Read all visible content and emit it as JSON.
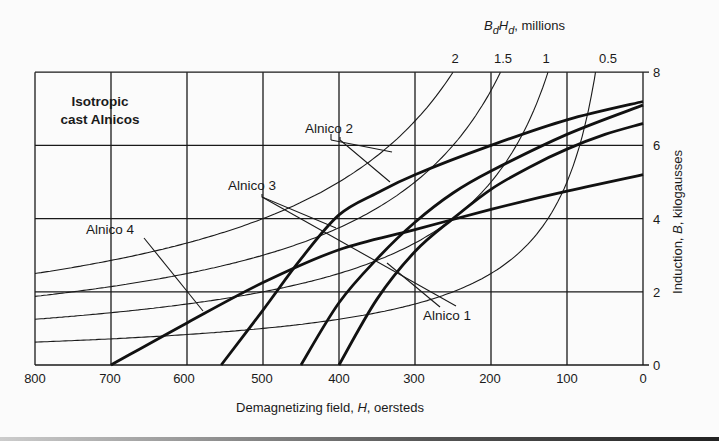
{
  "chart_data": {
    "type": "line",
    "title_line1": "Isotropic",
    "title_line2": "cast Alnicos",
    "xlabel": "Demagnetizing field, H, oersteds",
    "ylabel": "Induction, B, kilogausses",
    "top_axis_label": "BdHd, millions",
    "xlim": [
      800,
      0
    ],
    "ylim": [
      0,
      8
    ],
    "x_ticks": [
      800,
      700,
      600,
      500,
      400,
      300,
      200,
      100,
      0
    ],
    "y_ticks": [
      0,
      2,
      4,
      6,
      8
    ],
    "grid": true,
    "series": [
      {
        "name": "Alnico 1",
        "x": [
          400,
          350,
          300,
          250,
          200,
          150,
          100,
          50,
          0
        ],
        "values": [
          0,
          1.8,
          3.1,
          4.0,
          4.8,
          5.4,
          5.9,
          6.3,
          6.6
        ]
      },
      {
        "name": "Alnico 2",
        "x": [
          555,
          500,
          450,
          400,
          350,
          300,
          200,
          100,
          0
        ],
        "values": [
          0,
          1.5,
          2.9,
          4.1,
          4.7,
          5.2,
          6.0,
          6.7,
          7.2
        ]
      },
      {
        "name": "Alnico 3",
        "x": [
          450,
          400,
          350,
          300,
          250,
          200,
          100,
          0
        ],
        "values": [
          0,
          1.7,
          2.9,
          3.9,
          4.7,
          5.3,
          6.3,
          7.1
        ]
      },
      {
        "name": "Alnico 4",
        "x": [
          700,
          600,
          500,
          400,
          300,
          200,
          100,
          0
        ],
        "values": [
          0,
          1.15,
          2.25,
          3.15,
          3.7,
          4.25,
          4.75,
          5.2
        ]
      }
    ],
    "bh_product_curves": [
      {
        "label": "2",
        "value_millions": 2
      },
      {
        "label": "1.5",
        "value_millions": 1.5
      },
      {
        "label": "1",
        "value_millions": 1
      },
      {
        "label": "0.5",
        "value_millions": 0.5
      }
    ],
    "annotations": [
      "Alnico 1",
      "Alnico 2",
      "Alnico 3",
      "Alnico 4"
    ]
  },
  "labels": {
    "title1": "Isotropic",
    "title2": "cast Alnicos",
    "alnico1": "Alnico 1",
    "alnico2": "Alnico 2",
    "alnico3": "Alnico 3",
    "alnico4": "Alnico 4",
    "xlabel_pre": "Demagnetizing field, ",
    "xlabel_var": "H",
    "xlabel_post": ", oersteds",
    "ylabel_pre": "Induction, ",
    "ylabel_var": "B",
    "ylabel_post": ", kilogausses",
    "top_B": "B",
    "top_d1": "d",
    "top_H": "H",
    "top_d2": "d",
    "top_post": ", millions",
    "x_ticks": [
      "800",
      "700",
      "600",
      "500",
      "400",
      "300",
      "200",
      "100",
      "0"
    ],
    "y_ticks": [
      "0",
      "2",
      "4",
      "6",
      "8"
    ],
    "bh_ticks": [
      "2",
      "1.5",
      "1",
      "0.5"
    ]
  }
}
